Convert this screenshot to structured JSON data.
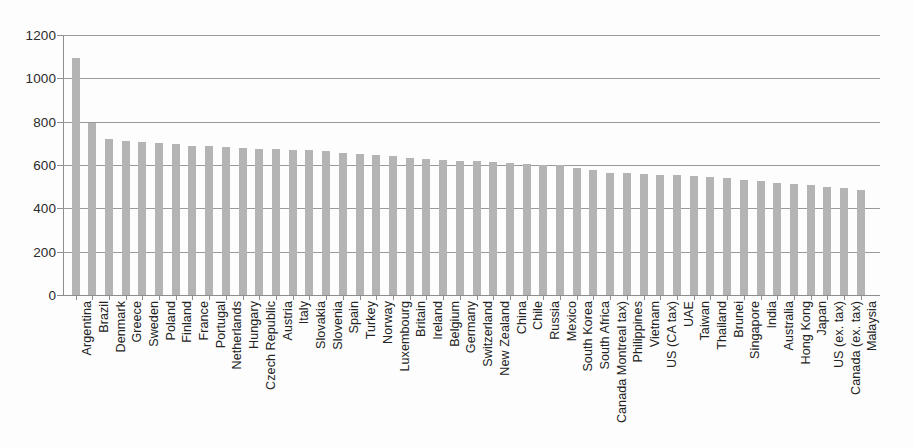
{
  "chart_data": {
    "type": "bar",
    "title": "",
    "subtitle": "",
    "xlabel": "",
    "ylabel": "",
    "ylim": [
      0,
      1200
    ],
    "ytick_values": [
      0,
      200,
      400,
      600,
      800,
      1000,
      1200
    ],
    "ytick_labels": [
      "0",
      "200",
      "400",
      "600",
      "800",
      "1000",
      "1200"
    ],
    "grid": true,
    "grid_axis": "y",
    "legend": false,
    "legend_position": "none",
    "bar_color": "#b4b4b4",
    "axis_color": "#8d8d8d",
    "categories": [
      "Argentina",
      "Brazil",
      "Denmark",
      "Greece",
      "Sweden",
      "Poland",
      "Finland",
      "France",
      "Portugal",
      "Netherlands",
      "Hungary",
      "Czech Republic",
      "Austria",
      "Italy",
      "Slovakia",
      "Slovenia",
      "Spain",
      "Turkey",
      "Norway",
      "Luxembourg",
      "Britain",
      "Ireland",
      "Belgium",
      "Germany",
      "Switzerland",
      "New Zealand",
      "China",
      "Chile",
      "Russia",
      "Mexico",
      "South Korea",
      "South Africa",
      "Canada Montreal tax)",
      "Philippines",
      "Vietnam",
      "US (CA tax)",
      "UAE",
      "Taiwan",
      "Thailand",
      "Brunei",
      "Singapore",
      "India",
      "Australia",
      "Hong Kong",
      "Japan",
      "US (ex. tax)",
      "Canada (ex. tax)",
      "Malaysia"
    ],
    "values": [
      1095,
      793,
      722,
      712,
      705,
      700,
      696,
      688,
      688,
      684,
      680,
      675,
      672,
      670,
      668,
      665,
      655,
      650,
      648,
      640,
      632,
      628,
      624,
      620,
      618,
      615,
      608,
      604,
      600,
      598,
      588,
      578,
      565,
      562,
      558,
      556,
      552,
      548,
      545,
      540,
      532,
      524,
      518,
      512,
      508,
      500,
      495,
      485
    ]
  }
}
